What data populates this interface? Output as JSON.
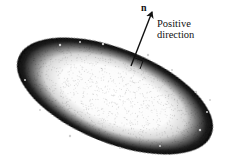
{
  "figure": {
    "type": "surface-normal-diagram",
    "surface": {
      "shape": "ellipse",
      "fill": "white center, dark stippled rim",
      "rotation_deg": 22
    },
    "vector": {
      "label": "n",
      "description": "normal vector perpendicular to surface"
    },
    "annotation": {
      "line1": "Positive",
      "line2": "direction"
    },
    "colors": {
      "ink": "#111111",
      "background": "#ffffff"
    }
  }
}
